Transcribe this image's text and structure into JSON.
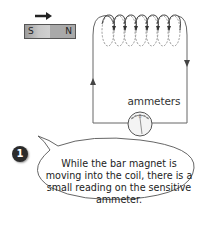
{
  "diagram": {
    "magnet": {
      "south_label": "S",
      "north_label": "N",
      "motion_direction": "right-arrow"
    },
    "coil": {
      "turns": 7
    },
    "meter_label": "ammeters",
    "step_badge": "1",
    "caption": "While the bar magnet is moving into the coil, there is a small reading on the sensitive ammeter.",
    "colors": {
      "wire": "#555555",
      "magnet_s": "#c8c8c8",
      "magnet_n": "#a9a9a9",
      "badge": "#2b2b2b"
    }
  }
}
